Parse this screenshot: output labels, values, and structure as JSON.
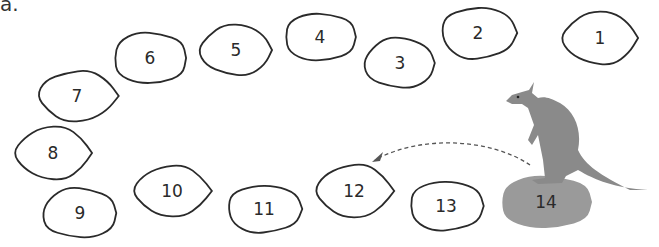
{
  "label": "a.",
  "stones": [
    {
      "n": "1",
      "cx": 600,
      "cy": 38,
      "rx": 38,
      "ry": 27
    },
    {
      "n": "2",
      "cx": 478,
      "cy": 33,
      "rx": 38,
      "ry": 27
    },
    {
      "n": "3",
      "cx": 400,
      "cy": 63,
      "rx": 37,
      "ry": 26
    },
    {
      "n": "4",
      "cx": 320,
      "cy": 37,
      "rx": 37,
      "ry": 25
    },
    {
      "n": "5",
      "cx": 236,
      "cy": 50,
      "rx": 37,
      "ry": 26
    },
    {
      "n": "6",
      "cx": 150,
      "cy": 58,
      "rx": 38,
      "ry": 27
    },
    {
      "n": "7",
      "cx": 77,
      "cy": 96,
      "rx": 39,
      "ry": 26
    },
    {
      "n": "8",
      "cx": 53,
      "cy": 153,
      "rx": 38,
      "ry": 27
    },
    {
      "n": "9",
      "cx": 80,
      "cy": 213,
      "rx": 39,
      "ry": 26
    },
    {
      "n": "10",
      "cx": 172,
      "cy": 191,
      "rx": 38,
      "ry": 26
    },
    {
      "n": "11",
      "cx": 264,
      "cy": 209,
      "rx": 38,
      "ry": 25
    },
    {
      "n": "12",
      "cx": 354,
      "cy": 191,
      "rx": 38,
      "ry": 27
    },
    {
      "n": "13",
      "cx": 446,
      "cy": 206,
      "rx": 38,
      "ry": 26
    }
  ],
  "start_stone": {
    "n": "14",
    "cx": 546,
    "cy": 202,
    "rx": 48,
    "ry": 28,
    "color": "#9a9a9a"
  },
  "kangaroo_color": "#8a8a8a",
  "arrow": {
    "from": "14",
    "to": "12"
  }
}
